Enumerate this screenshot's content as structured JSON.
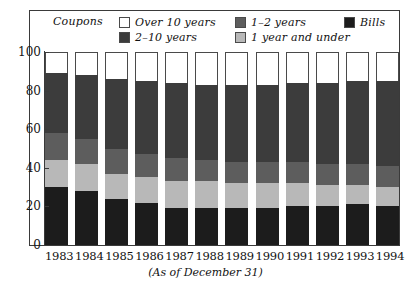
{
  "legend": {
    "title": "Coupons",
    "items": [
      {
        "label": "Over 10 years",
        "color": "#ffffff",
        "key": "over_10_years"
      },
      {
        "label": "1–2 years",
        "color": "#5d5d5d",
        "key": "one_to_two_years"
      },
      {
        "label": "Bills",
        "color": "#1c1c1c",
        "key": "bills"
      },
      {
        "label": "2–10 years",
        "color": "#3c3c3c",
        "key": "two_to_ten_years"
      },
      {
        "label": "1 year and under",
        "color": "#b8b8b8",
        "key": "one_year_and_under"
      }
    ]
  },
  "axis": {
    "y_ticks": [
      "100",
      "80",
      "60",
      "40",
      "20",
      "0"
    ],
    "y_min": 0,
    "y_max": 100
  },
  "caption": "(As of December 31)",
  "chart_data": {
    "type": "bar",
    "subtype": "stacked-100-percent",
    "title": "",
    "xlabel": "",
    "ylabel": "",
    "ylim": [
      0,
      100
    ],
    "grid": false,
    "legend_position": "top-inside",
    "annotation": "(As of December 31)",
    "categories": [
      "1983",
      "1984",
      "1985",
      "1986",
      "1987",
      "1988",
      "1989",
      "1990",
      "1991",
      "1992",
      "1993",
      "1994"
    ],
    "stack_order_bottom_to_top": [
      "Bills",
      "1 year and under",
      "1–2 years",
      "2–10 years",
      "Over 10 years"
    ],
    "series": [
      {
        "name": "Bills",
        "color": "#1c1c1c",
        "values": [
          30,
          28,
          24,
          22,
          19,
          19,
          19,
          19,
          20,
          20,
          21,
          20
        ]
      },
      {
        "name": "1 year and under",
        "color": "#b8b8b8",
        "values": [
          14,
          14,
          13,
          13,
          14,
          14,
          13,
          13,
          12,
          11,
          10,
          10
        ]
      },
      {
        "name": "1–2 years",
        "color": "#5d5d5d",
        "values": [
          14,
          13,
          13,
          12,
          12,
          11,
          11,
          11,
          11,
          11,
          11,
          11
        ]
      },
      {
        "name": "2–10 years",
        "color": "#3c3c3c",
        "values": [
          31,
          33,
          36,
          38,
          39,
          39,
          40,
          40,
          41,
          42,
          43,
          44
        ]
      },
      {
        "name": "Over 10 years",
        "color": "#ffffff",
        "values": [
          11,
          12,
          14,
          15,
          16,
          17,
          17,
          17,
          16,
          16,
          15,
          15
        ]
      }
    ]
  }
}
